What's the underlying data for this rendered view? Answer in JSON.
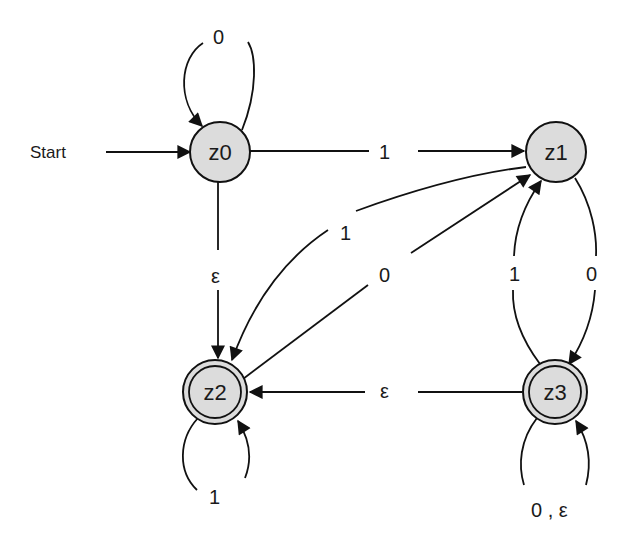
{
  "diagram": {
    "type": "finite-automaton",
    "start_label": "Start",
    "start_state": "z0",
    "states": [
      {
        "id": "z0",
        "label": "z0",
        "accepting": false,
        "cx": 220,
        "cy": 152
      },
      {
        "id": "z1",
        "label": "z1",
        "accepting": false,
        "cx": 556,
        "cy": 152
      },
      {
        "id": "z2",
        "label": "z2",
        "accepting": true,
        "cx": 215,
        "cy": 392
      },
      {
        "id": "z3",
        "label": "z3",
        "accepting": true,
        "cx": 555,
        "cy": 392
      }
    ],
    "transitions": [
      {
        "from": "z0",
        "to": "z0",
        "label": "0"
      },
      {
        "from": "z0",
        "to": "z1",
        "label": "1"
      },
      {
        "from": "z0",
        "to": "z2",
        "label": "ε"
      },
      {
        "from": "z1",
        "to": "z2",
        "label": "1"
      },
      {
        "from": "z2",
        "to": "z1",
        "label": "0"
      },
      {
        "from": "z1",
        "to": "z3",
        "label": "0"
      },
      {
        "from": "z3",
        "to": "z1",
        "label": "1"
      },
      {
        "from": "z3",
        "to": "z2",
        "label": "ε"
      },
      {
        "from": "z2",
        "to": "z2",
        "label": "1"
      },
      {
        "from": "z3",
        "to": "z3",
        "label": "0 , ε"
      }
    ],
    "colors": {
      "state_fill": "#dcdcdc",
      "stroke": "#111111",
      "background": "#ffffff"
    }
  }
}
